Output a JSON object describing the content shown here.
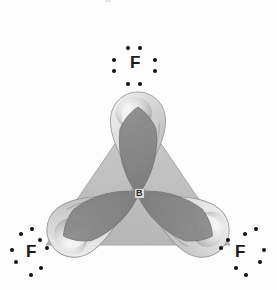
{
  "figure": {
    "background_color": "#fdfdfd",
    "style": "grayscale halftone scan"
  },
  "colors": {
    "lobe_light": "#e2e2e2",
    "lobe_mid": "#c9c9c9",
    "lobe_shadow": "#a8a8a8",
    "lobe_highlight": "#f4f4f4",
    "triangle_fill": "#c2c2c2",
    "wedge_dark": "#8f8f8f",
    "wedge_darker": "#7c7c7c",
    "outline": "#9a9a9a",
    "text": "#1a1a1a",
    "dot": "#101010"
  },
  "central_atom": {
    "symbol": "B",
    "name": "boron",
    "x": 138,
    "y": 193,
    "hybridization": "sp2",
    "lone_pairs": 0
  },
  "terminal_atoms": [
    {
      "id": "fluorine-top",
      "symbol": "F",
      "name": "fluorine",
      "position": "top",
      "label_x": 130,
      "label_y": 62,
      "lobe_angle_deg": 270,
      "lone_pair_count": 3,
      "bond_pair_count": 1,
      "dots": [
        {
          "x": 128,
          "y": 48
        },
        {
          "x": 140,
          "y": 48
        },
        {
          "x": 114,
          "y": 60
        },
        {
          "x": 114,
          "y": 71
        },
        {
          "x": 155,
          "y": 60
        },
        {
          "x": 155,
          "y": 71
        },
        {
          "x": 128,
          "y": 84
        },
        {
          "x": 140,
          "y": 84
        }
      ]
    },
    {
      "id": "fluorine-bottom-left",
      "symbol": "F",
      "name": "fluorine",
      "position": "bottom-left",
      "label_x": 26,
      "label_y": 251,
      "lobe_angle_deg": 150,
      "lone_pair_count": 3,
      "bond_pair_count": 1,
      "dots": [
        {
          "x": 21,
          "y": 234
        },
        {
          "x": 32,
          "y": 229
        },
        {
          "x": 12,
          "y": 250
        },
        {
          "x": 16,
          "y": 262
        },
        {
          "x": 41,
          "y": 268
        },
        {
          "x": 31,
          "y": 275
        },
        {
          "x": 40,
          "y": 240
        },
        {
          "x": 47,
          "y": 248
        }
      ]
    },
    {
      "id": "fluorine-bottom-right",
      "symbol": "F",
      "name": "fluorine",
      "position": "bottom-right",
      "label_x": 235,
      "label_y": 251,
      "lobe_angle_deg": 30,
      "lone_pair_count": 3,
      "bond_pair_count": 1,
      "dots": [
        {
          "x": 245,
          "y": 234
        },
        {
          "x": 256,
          "y": 229
        },
        {
          "x": 264,
          "y": 250
        },
        {
          "x": 260,
          "y": 262
        },
        {
          "x": 236,
          "y": 268
        },
        {
          "x": 246,
          "y": 275
        },
        {
          "x": 228,
          "y": 240
        },
        {
          "x": 221,
          "y": 248
        }
      ]
    }
  ],
  "bonds": [
    {
      "id": "bond-b-f-top",
      "from": "B",
      "to": "F",
      "type": "sigma",
      "overlap": "sp2-p"
    },
    {
      "id": "bond-b-f-bottom-left",
      "from": "B",
      "to": "F",
      "type": "sigma",
      "overlap": "sp2-p"
    },
    {
      "id": "bond-b-f-bottom-right",
      "from": "B",
      "to": "F",
      "type": "sigma",
      "overlap": "sp2-p"
    }
  ],
  "geometry": {
    "shape": "trigonal planar",
    "bond_angle_deg": 120
  },
  "artifacts": [
    {
      "id": "scan-speck-top",
      "x": 105,
      "y": 0,
      "width": 6,
      "height": 2
    }
  ]
}
